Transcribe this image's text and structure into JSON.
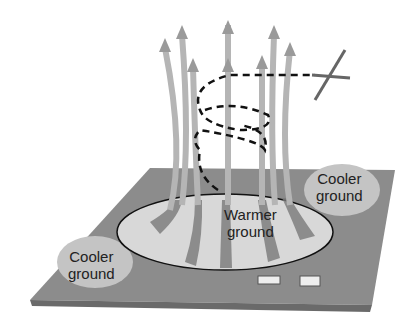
{
  "diagram": {
    "labels": {
      "cooler_left_line1": "Cooler",
      "cooler_left_line2": "ground",
      "cooler_right_line1": "Cooler",
      "cooler_right_line2": "ground",
      "warmer_line1": "Warmer",
      "warmer_line2": "ground"
    },
    "elements": [
      "ground-plane",
      "warm-area-ellipse",
      "rising-air-arrows",
      "glider-spiral-path",
      "glider"
    ],
    "colors": {
      "ground": "#8a8a8a",
      "arrow": "#b8b8b8",
      "path": "#111111"
    }
  }
}
